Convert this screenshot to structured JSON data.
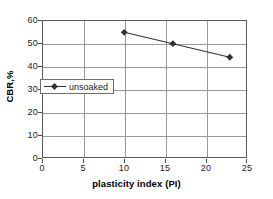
{
  "chart_data": {
    "type": "line",
    "title": "",
    "xlabel": "plasticity index (PI)",
    "ylabel": "CBR,%",
    "xlim": [
      0,
      25
    ],
    "ylim": [
      0,
      60
    ],
    "xticks": [
      0,
      5,
      10,
      15,
      20,
      25
    ],
    "yticks": [
      0,
      10,
      20,
      30,
      40,
      50,
      60
    ],
    "xtick_labels": [
      "0",
      "5",
      "10",
      "15",
      "20",
      "25"
    ],
    "ytick_labels": [
      "0",
      "10",
      "20",
      "30",
      "40",
      "50",
      "60"
    ],
    "grid": "both",
    "legend_position": "center-left-inside",
    "series": [
      {
        "name": "unsoaked",
        "marker": "diamond",
        "color": "#333333",
        "x": [
          10,
          16,
          23
        ],
        "values": [
          55,
          50,
          44
        ],
        "points": [
          {
            "x": 10,
            "y": 55
          },
          {
            "x": 16,
            "y": 50
          },
          {
            "x": 23,
            "y": 44
          }
        ]
      }
    ],
    "legend": [
      "unsoaked"
    ]
  },
  "colors": {
    "axis": "#5a5a5a",
    "grid": "#9a9a9a",
    "series": "#333333",
    "text": "#1a1a1a",
    "background": "#ffffff"
  }
}
